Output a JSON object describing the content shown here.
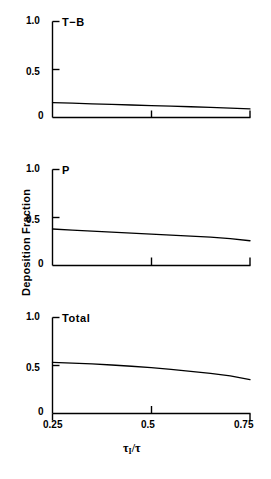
{
  "figure": {
    "ylabel": "Deposition Fraction",
    "xlabel_numerator": "τ",
    "xlabel_subscript": "I",
    "xlabel_denominator": "/τ",
    "line_color": "#000000",
    "background_color": "#ffffff",
    "axis_color": "#000000"
  },
  "yticks": {
    "top": "1.0",
    "mid": "0.5",
    "bottom": "0"
  },
  "xticks": {
    "left": "0.25",
    "mid": "0.5",
    "right": "0.75"
  },
  "panels": [
    {
      "title": "T−B"
    },
    {
      "title": "P"
    },
    {
      "title": "Total"
    }
  ],
  "chart_data": [
    {
      "type": "line",
      "title": "T−B",
      "xlabel": "τ_I / τ",
      "ylabel": "Deposition Fraction",
      "xlim": [
        0.25,
        0.75
      ],
      "ylim": [
        0.0,
        1.0
      ],
      "xticks": [
        0.25,
        0.5,
        0.75
      ],
      "yticks": [
        0.0,
        0.5,
        1.0
      ],
      "grid": false,
      "legend": "none",
      "x": [
        0.25,
        0.3,
        0.35,
        0.4,
        0.45,
        0.5,
        0.55,
        0.6,
        0.65,
        0.7,
        0.75
      ],
      "values": [
        0.155,
        0.149,
        0.142,
        0.136,
        0.13,
        0.124,
        0.118,
        0.112,
        0.105,
        0.098,
        0.09
      ]
    },
    {
      "type": "line",
      "title": "P",
      "xlabel": "τ_I / τ",
      "ylabel": "Deposition Fraction",
      "xlim": [
        0.25,
        0.75
      ],
      "ylim": [
        0.0,
        1.0
      ],
      "xticks": [
        0.25,
        0.5,
        0.75
      ],
      "yticks": [
        0.0,
        0.5,
        1.0
      ],
      "grid": false,
      "legend": "none",
      "x": [
        0.25,
        0.3,
        0.35,
        0.4,
        0.45,
        0.5,
        0.55,
        0.6,
        0.65,
        0.7,
        0.75
      ],
      "values": [
        0.38,
        0.369,
        0.358,
        0.347,
        0.337,
        0.327,
        0.317,
        0.307,
        0.296,
        0.28,
        0.258
      ]
    },
    {
      "type": "line",
      "title": "Total",
      "xlabel": "τ_I / τ",
      "ylabel": "Deposition Fraction",
      "xlim": [
        0.25,
        0.75
      ],
      "ylim": [
        0.0,
        1.0
      ],
      "xticks": [
        0.25,
        0.5,
        0.75
      ],
      "yticks": [
        0.0,
        0.5,
        1.0
      ],
      "grid": false,
      "legend": "none",
      "x": [
        0.25,
        0.3,
        0.35,
        0.4,
        0.45,
        0.5,
        0.55,
        0.6,
        0.65,
        0.7,
        0.75
      ],
      "values": [
        0.532,
        0.525,
        0.516,
        0.505,
        0.492,
        0.477,
        0.459,
        0.439,
        0.417,
        0.392,
        0.352
      ]
    }
  ]
}
